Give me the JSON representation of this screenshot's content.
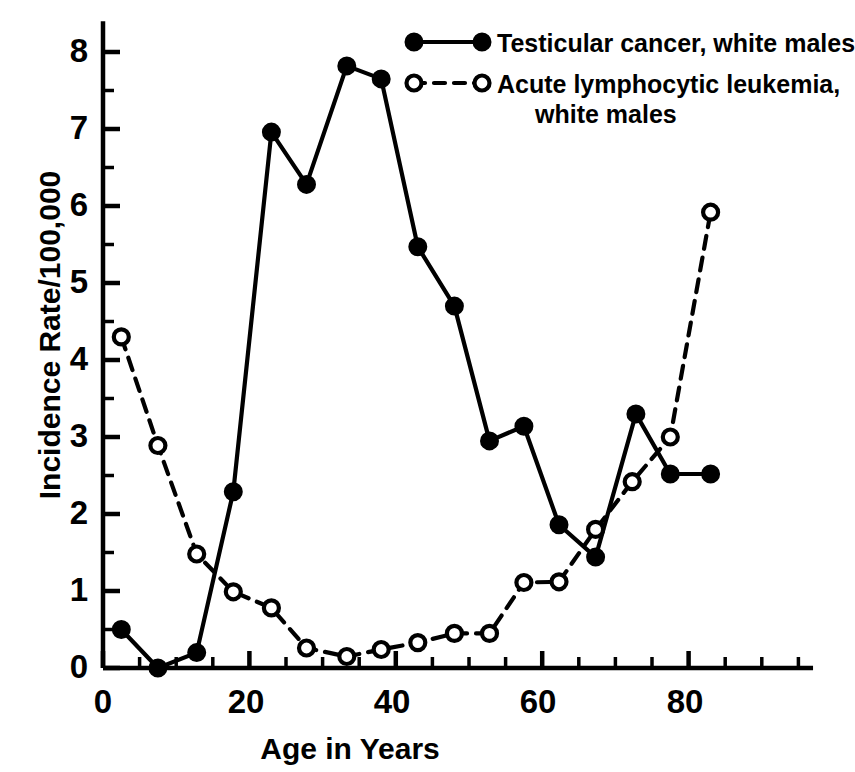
{
  "chart_data": {
    "type": "line",
    "title": "",
    "xlabel": "Age in Years",
    "ylabel": "Incidence Rate/100,000",
    "xlim": [
      0,
      97
    ],
    "ylim": [
      0,
      8.4
    ],
    "grid": false,
    "legend_position": "top-right",
    "x_major_ticks": [
      0,
      20,
      40,
      60,
      80
    ],
    "x_major_tick_labels": [
      "0",
      "20",
      "40",
      "60",
      "80"
    ],
    "x_minor_tick_step": 5,
    "y_major_ticks": [
      0,
      1,
      2,
      3,
      4,
      5,
      6,
      7,
      8
    ],
    "y_major_tick_labels": [
      "0",
      "1",
      "2",
      "3",
      "4",
      "5",
      "6",
      "7",
      "8"
    ],
    "y_minor_tick_step": 0.5,
    "series": [
      {
        "name": "Testicular cancer, white males",
        "marker": "filled-circle",
        "linestyle": "solid",
        "color": "#000000",
        "x": [
          2.5,
          7.5,
          12.8,
          17.8,
          23.0,
          27.8,
          33.3,
          38.0,
          43.0,
          48.0,
          52.8,
          57.5,
          62.3,
          67.3,
          72.8,
          77.5,
          83.0
        ],
        "values": [
          0.5,
          0.0,
          0.2,
          2.29,
          6.96,
          6.28,
          7.82,
          7.65,
          5.47,
          4.7,
          2.95,
          3.14,
          1.86,
          1.44,
          3.3,
          2.52,
          2.52
        ]
      },
      {
        "name": "Acute lymphocytic leukemia, white males",
        "marker": "open-circle",
        "linestyle": "dashed",
        "color": "#000000",
        "x": [
          2.5,
          7.5,
          12.8,
          17.8,
          23.0,
          27.8,
          33.3,
          38.0,
          43.0,
          48.0,
          52.8,
          57.5,
          62.3,
          67.3,
          72.3,
          77.5,
          83.0
        ],
        "values": [
          4.3,
          2.89,
          1.48,
          0.99,
          0.78,
          0.26,
          0.15,
          0.24,
          0.33,
          0.45,
          0.45,
          1.11,
          1.12,
          1.8,
          2.42,
          3.0,
          5.92
        ]
      }
    ]
  },
  "legend": {
    "entries": [
      {
        "marker": "filled-circle",
        "linestyle": "solid",
        "lines": [
          "Testicular cancer, white males"
        ]
      },
      {
        "marker": "open-circle",
        "linestyle": "dashed",
        "lines": [
          "Acute lymphocytic leukemia,",
          "white males"
        ]
      }
    ]
  },
  "axes": {
    "y_label": "Incidence Rate/100,000",
    "x_label": "Age in Years",
    "y_ticks": [
      "8",
      "7",
      "6",
      "5",
      "4",
      "3",
      "2",
      "1",
      "0"
    ],
    "x_ticks": [
      "0",
      "20",
      "40",
      "60",
      "80"
    ]
  }
}
